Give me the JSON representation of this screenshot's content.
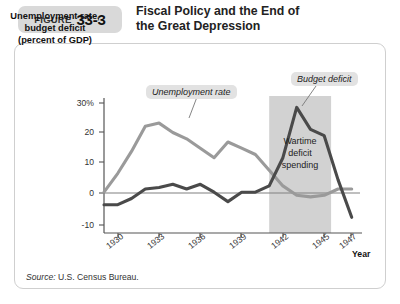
{
  "header": {
    "figure_word": "FIGURE",
    "figure_number": "33-3",
    "title_line1": "Fiscal Policy and the End of",
    "title_line2": "the Great Depression"
  },
  "source": {
    "prefix": "Source:",
    "text": " U.S. Census Bureau."
  },
  "annotations": {
    "unemployment_callout": "Unemployment rate",
    "deficit_callout": "Budget deficit",
    "wartime_line1": "Wartime",
    "wartime_line2": "deficit",
    "wartime_line3": "spending"
  },
  "colors": {
    "unemployment_line": "#9a9a9a",
    "deficit_line": "#4a4a4a",
    "shaded_band": "#d2d2d2",
    "callout_bg": "#e2e2e2",
    "axis": "#555555",
    "figure_tab": "#d9d9d9"
  },
  "chart_data": {
    "type": "line",
    "title": "Fiscal Policy and the End of the Great Depression",
    "ylabel": "Unemployment rate, budget deficit (percent of GDP)",
    "xlabel": "Year",
    "ylim": [
      -10,
      33
    ],
    "xlim": [
      1929,
      1947.6
    ],
    "yticks": [
      30,
      20,
      10,
      0,
      -10
    ],
    "ytick_labels": [
      "30%",
      "20",
      "10",
      "0",
      "-10"
    ],
    "xticks": [
      1930,
      1933,
      1936,
      1939,
      1942,
      1945,
      1947
    ],
    "xtick_labels": [
      "1930",
      "1933",
      "1936",
      "1939",
      "1942",
      "1945",
      "1947"
    ],
    "grid": false,
    "legend": "inline-callouts",
    "shaded_region": {
      "label": "Wartime deficit spending",
      "x_start": 1941.0,
      "x_end": 1945.5
    },
    "x": [
      1929,
      1930,
      1931,
      1932,
      1933,
      1934,
      1935,
      1936,
      1937,
      1938,
      1939,
      1940,
      1941,
      1942,
      1943,
      1944,
      1945,
      1946,
      1947
    ],
    "series": [
      {
        "name": "Unemployment rate",
        "values": [
          3,
          9,
          16,
          24,
          25,
          22,
          20,
          17,
          14,
          19,
          17,
          15,
          10,
          5,
          2,
          1.5,
          2,
          4,
          4
        ]
      },
      {
        "name": "Budget deficit",
        "values": [
          -1,
          -1,
          1,
          4,
          4.5,
          5.5,
          4,
          5.5,
          3,
          0,
          3,
          3,
          5,
          14,
          30,
          23,
          21,
          7,
          -5
        ]
      }
    ]
  }
}
